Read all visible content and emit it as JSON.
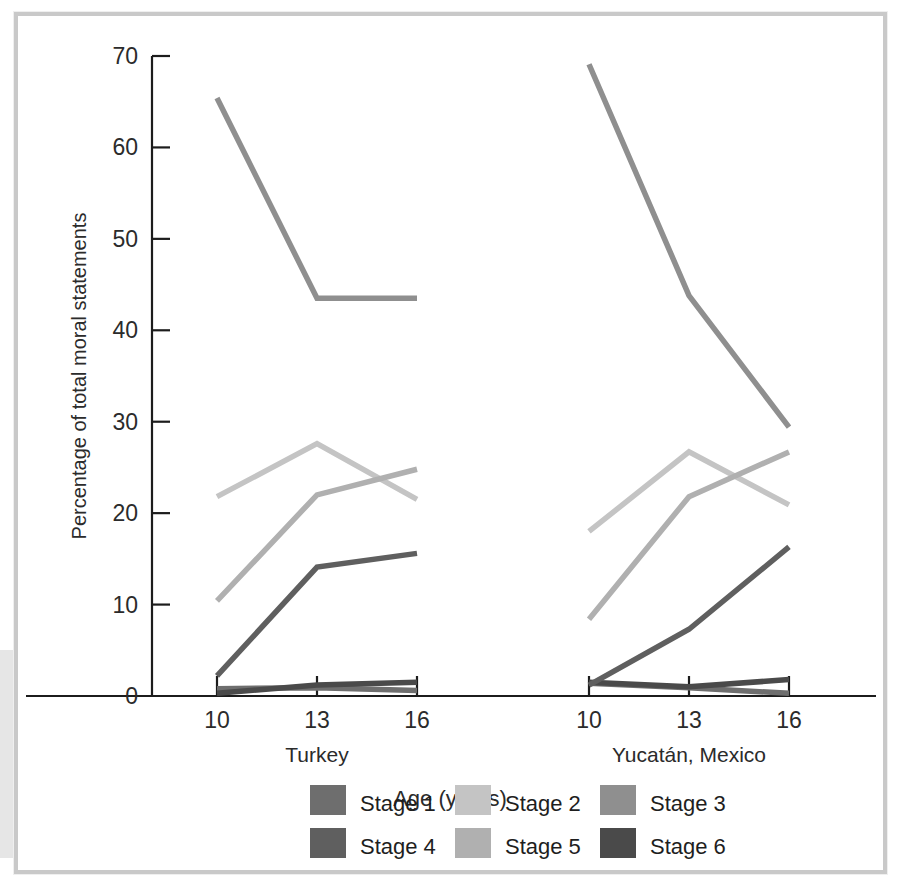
{
  "figure": {
    "background_color": "#ffffff",
    "frame_color": "#c9c9c9"
  },
  "axis": {
    "y_title": "Percentage of total moral statements",
    "y_ticks": [
      "0",
      "10",
      "20",
      "30",
      "40",
      "50",
      "60",
      "70"
    ],
    "x_title": "Age (years)",
    "x_tick_labels_turkey": [
      "10",
      "13",
      "16"
    ],
    "x_tick_labels_yucatan": [
      "10",
      "13",
      "16"
    ],
    "group_label_left": "Turkey",
    "group_label_right": "Yucatán, Mexico"
  },
  "legend": {
    "items": [
      {
        "label": "Stage 1",
        "color": "#6e6e6e"
      },
      {
        "label": "Stage 2",
        "color": "#c4c4c4"
      },
      {
        "label": "Stage 3",
        "color": "#8f8f8f"
      },
      {
        "label": "Stage 4",
        "color": "#5f5f5f"
      },
      {
        "label": "Stage 5",
        "color": "#b0b0b0"
      },
      {
        "label": "Stage 6",
        "color": "#4a4a4a"
      }
    ]
  },
  "chart_data": {
    "type": "line",
    "title": "",
    "xlabel": "Age (years)",
    "ylabel": "Percentage of total moral statements",
    "ylim": [
      0,
      70
    ],
    "ytick_step": 10,
    "grid": false,
    "legend_position": "bottom",
    "panels": [
      {
        "name": "Turkey",
        "x": [
          10,
          13,
          16
        ],
        "series": [
          {
            "name": "Stage 1",
            "color": "#6e6e6e",
            "values": [
              0.8,
              0.9,
              0.6
            ]
          },
          {
            "name": "Stage 2",
            "color": "#c4c4c4",
            "values": [
              21.8,
              27.6,
              21.5
            ]
          },
          {
            "name": "Stage 3",
            "color": "#8f8f8f",
            "values": [
              65.4,
              43.5,
              43.5
            ]
          },
          {
            "name": "Stage 4",
            "color": "#5f5f5f",
            "values": [
              2.2,
              14.1,
              15.6
            ]
          },
          {
            "name": "Stage 5",
            "color": "#b0b0b0",
            "values": [
              10.4,
              22.0,
              24.8
            ]
          },
          {
            "name": "Stage 6",
            "color": "#4a4a4a",
            "values": [
              0.3,
              1.2,
              1.5
            ]
          }
        ]
      },
      {
        "name": "Yucatán, Mexico",
        "x": [
          10,
          13,
          16
        ],
        "series": [
          {
            "name": "Stage 1",
            "color": "#6e6e6e",
            "values": [
              1.4,
              0.9,
              0.3
            ]
          },
          {
            "name": "Stage 2",
            "color": "#c4c4c4",
            "values": [
              18.0,
              26.7,
              20.9
            ]
          },
          {
            "name": "Stage 3",
            "color": "#8f8f8f",
            "values": [
              69.1,
              43.8,
              29.4
            ]
          },
          {
            "name": "Stage 4",
            "color": "#5f5f5f",
            "values": [
              1.2,
              7.3,
              16.3
            ]
          },
          {
            "name": "Stage 5",
            "color": "#b0b0b0",
            "values": [
              8.4,
              21.8,
              26.7
            ]
          },
          {
            "name": "Stage 6",
            "color": "#4a4a4a",
            "values": [
              1.5,
              1.0,
              1.8
            ]
          }
        ]
      }
    ]
  }
}
